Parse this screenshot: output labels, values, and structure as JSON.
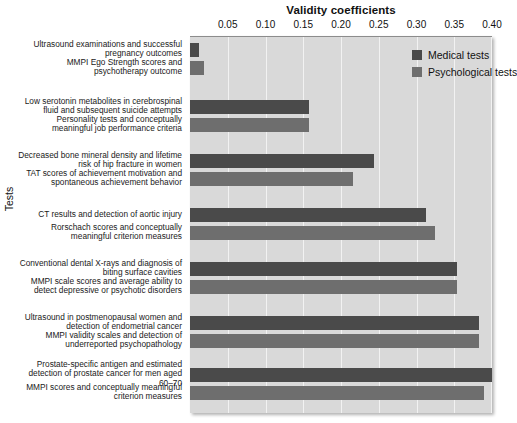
{
  "chart_data": {
    "type": "bar",
    "orientation": "horizontal",
    "title": "Validity coefficients",
    "xlabel": "Validity coefficients",
    "ylabel": "Tests",
    "xlim": [
      0,
      0.4
    ],
    "xticks": [
      0.05,
      0.1,
      0.15,
      0.2,
      0.25,
      0.3,
      0.35,
      0.4
    ],
    "xtick_labels": [
      "0.05",
      "0.10",
      "0.15",
      "0.20",
      "0.25",
      "0.30",
      "0.35",
      "0.40"
    ],
    "grid": true,
    "legend_position": "top-right",
    "legend": [
      {
        "name": "Medical tests",
        "color": "#4a4a4a"
      },
      {
        "name": "Psychological tests",
        "color": "#6e6e6e"
      }
    ],
    "categories": [
      "Ultrasound examinations and successful pregnancy outcomes",
      "MMPI Ego Strength scores and psychotherapy outcome",
      "Low serotonin metabolites in cerebrospinal fluid and subsequent suicide attempts",
      "Personality tests and conceptually meaningful job performance criteria",
      "Decreased bone mineral density and lifetime risk of hip fracture in women",
      "TAT scores of achievement motivation and spontaneous achievement behavior",
      "CT results and detection of aortic injury",
      "Rorschach scores and conceptually meaningful criterion measures",
      "Conventional dental X-rays and diagnosis of biting surface cavities",
      "MMPI scale scores and average ability to detect depressive or psychotic disorders",
      "Ultrasound in postmenopausal women and detection of endometrial cancer",
      "MMPI validity scales and detection of underreported psychopathology",
      "Prostate-specific antigen and estimated detection of prostate cancer for men aged 60–70",
      "MMPI scores and conceptually meaningful criterion measures"
    ],
    "bars": [
      {
        "label": "Ultrasound examinations and successful pregnancy outcomes",
        "series": "Medical tests",
        "value": 0.012
      },
      {
        "label": "MMPI Ego Strength scores and psychotherapy outcome",
        "series": "Psychological tests",
        "value": 0.018
      },
      {
        "label": "Low serotonin metabolites in cerebrospinal fluid and subsequent suicide attempts",
        "series": "Medical tests",
        "value": 0.157
      },
      {
        "label": "Personality tests and conceptually meaningful job performance criteria",
        "series": "Psychological tests",
        "value": 0.157
      },
      {
        "label": "Decreased bone mineral density and lifetime risk of hip fracture in women",
        "series": "Medical tests",
        "value": 0.244
      },
      {
        "label": "TAT scores of achievement motivation and spontaneous achievement behavior",
        "series": "Psychological tests",
        "value": 0.216
      },
      {
        "label": "CT results and detection of aortic injury",
        "series": "Medical tests",
        "value": 0.313
      },
      {
        "label": "Rorschach scores and conceptually meaningful criterion measures",
        "series": "Psychological tests",
        "value": 0.325
      },
      {
        "label": "Conventional dental X-rays and diagnosis of biting surface cavities",
        "series": "Medical tests",
        "value": 0.353
      },
      {
        "label": "MMPI scale scores and average ability to detect depressive or psychotic disorders",
        "series": "Psychological tests",
        "value": 0.353
      },
      {
        "label": "Ultrasound in postmenopausal women and detection of endometrial cancer",
        "series": "Medical tests",
        "value": 0.383
      },
      {
        "label": "MMPI validity scales and detection of underreported psychopathology",
        "series": "Psychological tests",
        "value": 0.383
      },
      {
        "label": "Prostate-specific antigen and estimated detection of prostate cancer for men aged 60–70",
        "series": "Medical tests",
        "value": 0.4
      },
      {
        "label": "MMPI scores and conceptually meaningful criterion measures",
        "series": "Psychological tests",
        "value": 0.39
      }
    ]
  },
  "colors": {
    "medical": "#4a4a4a",
    "psychological": "#6e6e6e",
    "plot_background": "#d9d9d9",
    "gridline": "#f2f2f2",
    "page_background": "#ffffff"
  }
}
